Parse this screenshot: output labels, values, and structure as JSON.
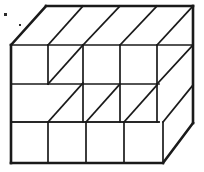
{
  "figure": {
    "type": "line-drawing",
    "width": 204,
    "height": 172,
    "background_color": "#ffffff",
    "stroke_color": "#1a1a1a",
    "stroke_width_outline": 2.6,
    "stroke_width_inner": 1.7,
    "counts": {
      "columns_across_top": 4,
      "rows_on_right_side": 3,
      "front_face_columns": 4,
      "front_face_rows": 3
    },
    "geometry": {
      "depth_dx": 35,
      "depth_dy": -39,
      "cell_w": 37,
      "cell_h": 39,
      "front_origin": {
        "x": 11,
        "y": 45
      },
      "outline": [
        [
          11,
          45
        ],
        [
          46,
          6
        ],
        [
          193,
          6
        ],
        [
          193,
          45
        ],
        [
          193,
          123
        ],
        [
          163,
          163
        ],
        [
          11,
          163
        ]
      ],
      "polylines": [
        {
          "name": "top-back-edge",
          "points": [
            [
              46,
              6
            ],
            [
              193,
              6
            ]
          ],
          "weight": "outline"
        },
        {
          "name": "top-left-ridge",
          "points": [
            [
              11,
              45
            ],
            [
              46,
              6
            ]
          ],
          "weight": "outline"
        },
        {
          "name": "right-back-vertical",
          "points": [
            [
              193,
              6
            ],
            [
              193,
              123
            ]
          ],
          "weight": "outline"
        },
        {
          "name": "left-front-vertical",
          "points": [
            [
              11,
              45
            ],
            [
              11,
              163
            ]
          ],
          "weight": "outline"
        },
        {
          "name": "bottom-front-edge",
          "points": [
            [
              11,
              163
            ],
            [
              163,
              163
            ]
          ],
          "weight": "outline"
        },
        {
          "name": "bottom-right-ridge",
          "points": [
            [
              163,
              163
            ],
            [
              193,
              123
            ]
          ],
          "weight": "outline"
        },
        {
          "name": "top-front-edge-main",
          "points": [
            [
              48,
              45
            ],
            [
              193,
              45
            ]
          ],
          "weight": "inner"
        },
        {
          "name": "protruding-cube-top-left",
          "points": [
            [
              11,
              45
            ],
            [
              48,
              45
            ]
          ],
          "weight": "inner"
        },
        {
          "name": "protruding-cube-front-right-vert",
          "points": [
            [
              48,
              45
            ],
            [
              48,
              84
            ]
          ],
          "weight": "inner"
        },
        {
          "name": "protruding-cube-ridge-upper",
          "points": [
            [
              48,
              45
            ],
            [
              83,
              6
            ]
          ],
          "weight": "inner"
        },
        {
          "name": "protruding-cube-ridge-lower",
          "points": [
            [
              48,
              84
            ],
            [
              83,
              45
            ]
          ],
          "weight": "inner"
        },
        {
          "name": "protruding-cube-bottom",
          "points": [
            [
              11,
              84
            ],
            [
              48,
              84
            ]
          ],
          "weight": "inner"
        },
        {
          "name": "mid-row-divider-left",
          "points": [
            [
              11,
              84
            ],
            [
              11,
              84
            ]
          ],
          "weight": "inner"
        },
        {
          "name": "row1-divider-front",
          "points": [
            [
              48,
              84
            ],
            [
              159,
              84
            ]
          ],
          "weight": "inner"
        },
        {
          "name": "row2-divider-front",
          "points": [
            [
              11,
              122
            ],
            [
              159,
              122
            ]
          ],
          "weight": "inner"
        },
        {
          "name": "col-div-1-upper",
          "points": [
            [
              83,
              45
            ],
            [
              83,
              122
            ]
          ],
          "weight": "inner"
        },
        {
          "name": "col-div-2-upper",
          "points": [
            [
              120,
              45
            ],
            [
              120,
              122
            ]
          ],
          "weight": "inner"
        },
        {
          "name": "col-div-3-upper",
          "points": [
            [
              157,
              45
            ],
            [
              157,
              122
            ]
          ],
          "weight": "inner"
        },
        {
          "name": "bottom-row-front-top",
          "points": [
            [
              11,
              122
            ],
            [
              159,
              122
            ]
          ],
          "weight": "inner"
        },
        {
          "name": "bottom-row-col-1",
          "points": [
            [
              48,
              122
            ],
            [
              48,
              163
            ]
          ],
          "weight": "inner"
        },
        {
          "name": "bottom-row-col-2",
          "points": [
            [
              86,
              122
            ],
            [
              86,
              163
            ]
          ],
          "weight": "inner"
        },
        {
          "name": "bottom-row-col-3",
          "points": [
            [
              124,
              122
            ],
            [
              124,
              163
            ]
          ],
          "weight": "inner"
        },
        {
          "name": "bottom-row-right-vert",
          "points": [
            [
              163,
              122
            ],
            [
              163,
              163
            ]
          ],
          "weight": "inner"
        },
        {
          "name": "bottom-row-ridge-0",
          "points": [
            [
              48,
              122
            ],
            [
              83,
              83
            ]
          ],
          "weight": "inner"
        },
        {
          "name": "bottom-row-ridge-1",
          "points": [
            [
              86,
              122
            ],
            [
              120,
              84
            ]
          ],
          "weight": "inner"
        },
        {
          "name": "bottom-row-ridge-2",
          "points": [
            [
              124,
              122
            ],
            [
              157,
              85
            ]
          ],
          "weight": "inner"
        },
        {
          "name": "bottom-row-ridge-3",
          "points": [
            [
              163,
              122
            ],
            [
              193,
              85
            ]
          ],
          "weight": "inner"
        },
        {
          "name": "right-face-ridge-top",
          "points": [
            [
              157,
              45
            ],
            [
              193,
              6
            ]
          ],
          "weight": "inner"
        },
        {
          "name": "right-face-ridge-mid",
          "points": [
            [
              157,
              84
            ],
            [
              193,
              45
            ]
          ],
          "weight": "inner"
        },
        {
          "name": "right-face-row-div-1",
          "points": [
            [
              193,
              45
            ],
            [
              193,
              45
            ]
          ],
          "weight": "inner"
        },
        {
          "name": "top-face-ridge-1",
          "points": [
            [
              83,
              45
            ],
            [
              120,
              6
            ]
          ],
          "weight": "inner"
        },
        {
          "name": "top-face-ridge-2",
          "points": [
            [
              120,
              45
            ],
            [
              157,
              6
            ]
          ],
          "weight": "inner"
        }
      ],
      "specks": [
        {
          "x": 4,
          "y": 13,
          "w": 3,
          "h": 3
        },
        {
          "x": 19,
          "y": 24,
          "w": 2,
          "h": 2
        }
      ]
    }
  }
}
